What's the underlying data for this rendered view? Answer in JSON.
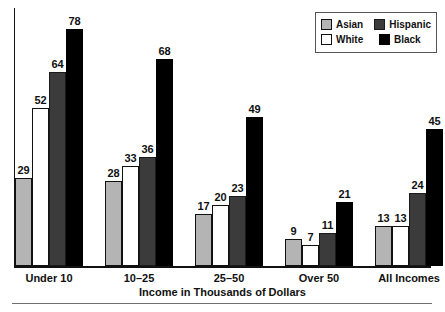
{
  "chart_data": {
    "type": "bar",
    "title": "",
    "xlabel": "Income in Thousands of Dollars",
    "ylabel": "",
    "categories": [
      "Under 10",
      "10–25",
      "25–50",
      "Over 50",
      "All Incomes"
    ],
    "series": [
      {
        "name": "Asian",
        "color": "#b4b4b4",
        "values": [
          29,
          28,
          17,
          9,
          13
        ]
      },
      {
        "name": "White",
        "color": "#ffffff",
        "values": [
          52,
          33,
          20,
          7,
          13
        ]
      },
      {
        "name": "Hispanic",
        "color": "#3b3b3b",
        "values": [
          64,
          36,
          23,
          11,
          24
        ]
      },
      {
        "name": "Black",
        "color": "#000000",
        "values": [
          78,
          68,
          49,
          21,
          45
        ]
      }
    ],
    "ylim": [
      0,
      78
    ],
    "grid": false,
    "legend_position": "top-right",
    "value_labels": true
  },
  "legend": {
    "items": [
      {
        "label": "Asian",
        "swatch": "asian"
      },
      {
        "label": "Hispanic",
        "swatch": "hispanic"
      },
      {
        "label": "White",
        "swatch": "white"
      },
      {
        "label": "Black",
        "swatch": "black"
      }
    ]
  },
  "axis": {
    "x_title": "Income in Thousands of Dollars"
  }
}
